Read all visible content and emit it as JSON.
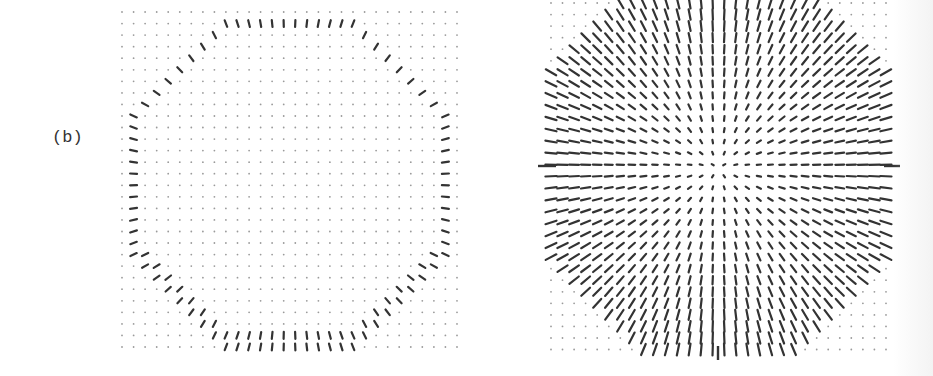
{
  "figure": {
    "panel_label": "(b)",
    "colors": {
      "ink": "#333333",
      "dot": "#9a9a9a",
      "background": "#ffffff"
    }
  },
  "left_panel": {
    "description": "Vector-field grid showing oriented needles only on an octagon-shaped ring boundary",
    "grid": {
      "x0": 122,
      "y0": 12,
      "spacing": 11.55,
      "cols": 30,
      "rows": 30
    },
    "ring": {
      "cx": 289,
      "cy": 184,
      "radius": 158,
      "band": 7,
      "needle_len": 7
    }
  },
  "right_panel": {
    "description": "Vector-field grid showing radially oriented needles filling a disk; needle length grows with distance from center",
    "grid": {
      "x0": 551,
      "y0": 3,
      "spacing": 11.55,
      "cols": 30,
      "rows": 31
    },
    "disk": {
      "cx": 718,
      "cy": 168,
      "radius": 183,
      "max_len": 12
    },
    "axis_ticks": [
      {
        "orientation": "horizontal",
        "x1": 538,
        "y1": 166,
        "x2": 556,
        "y2": 166
      },
      {
        "orientation": "horizontal",
        "x1": 884,
        "y1": 166,
        "x2": 900,
        "y2": 166
      },
      {
        "orientation": "vertical",
        "x1": 718,
        "y1": 346,
        "x2": 718,
        "y2": 360
      }
    ]
  }
}
